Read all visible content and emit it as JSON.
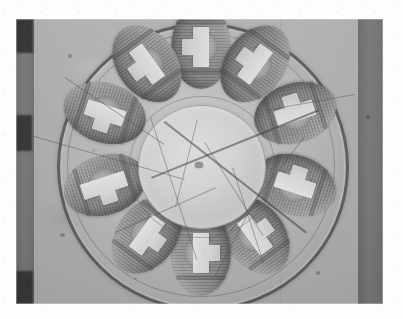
{
  "page": {
    "background_color": "#fdfdfb",
    "media": "halftone printed photograph"
  },
  "photo": {
    "caption": "",
    "kind": "black-and-white halftone photograph",
    "subject": "radial coil assembly (stator / armature) with ten wound coils around a central hub",
    "frame": {
      "x": 16,
      "y": 19,
      "width": 367,
      "height": 285
    },
    "tone": {
      "paper": "#fdfdfb",
      "midtone": "#b9b8b2",
      "highlight": "#f2f1ec",
      "shadow": "#3a3834",
      "rim": "#3a3834"
    },
    "background": {
      "name": "light textured board wall",
      "color": "#bcbbb4",
      "posts": [
        {
          "name": "left-post",
          "x": 0,
          "width": 18,
          "color": "#5c5a55"
        },
        {
          "name": "right-post",
          "x": 342,
          "width": 26,
          "color": "#6c6a64"
        }
      ],
      "specks": [
        {
          "x": 52,
          "y": 35,
          "r": 2.2
        },
        {
          "x": 245,
          "y": 30,
          "r": 2.0
        },
        {
          "x": 350,
          "y": 96,
          "r": 2.0
        },
        {
          "x": 44,
          "y": 214,
          "r": 2.4
        },
        {
          "x": 300,
          "y": 252,
          "r": 2.0
        },
        {
          "x": 118,
          "y": 258,
          "r": 1.8
        },
        {
          "x": 76,
          "y": 130,
          "r": 1.6
        }
      ]
    },
    "assembly": {
      "name": "coil assembly",
      "outer_rim": {
        "name": "outer rim ring",
        "color": "#3a3834",
        "stroke": 3
      },
      "hub": {
        "name": "central hub disc",
        "color": "#dcdbd4"
      },
      "coil_count": 10,
      "coils": [
        {
          "id": 1,
          "label": "coil-1",
          "angle": 0,
          "cx": 146,
          "cy": 30
        },
        {
          "id": 2,
          "label": "coil-2",
          "angle": 36,
          "cx": 200,
          "cy": 47
        },
        {
          "id": 3,
          "label": "coil-3",
          "angle": 72,
          "cx": 240,
          "cy": 96
        },
        {
          "id": 4,
          "label": "coil-4",
          "angle": 108,
          "cx": 240,
          "cy": 168
        },
        {
          "id": 5,
          "label": "coil-5",
          "angle": 144,
          "cx": 200,
          "cy": 218
        },
        {
          "id": 6,
          "label": "coil-6",
          "angle": 180,
          "cx": 146,
          "cy": 236
        },
        {
          "id": 7,
          "label": "coil-7",
          "angle": 216,
          "cx": 92,
          "cy": 218
        },
        {
          "id": 8,
          "label": "coil-8",
          "angle": 252,
          "cx": 50,
          "cy": 168
        },
        {
          "id": 9,
          "label": "coil-9",
          "angle": 288,
          "cx": 50,
          "cy": 96
        },
        {
          "id": 10,
          "label": "coil-10",
          "angle": 324,
          "cx": 92,
          "cy": 47
        }
      ],
      "coil_detail": {
        "winding_color": "#8a8780",
        "tape_color": "#f2f1ec",
        "note": "each coil is an oval winding with a light insulating tape band across its middle"
      },
      "wires": [
        {
          "name": "lead-wire-1",
          "x": 10,
          "y": 60,
          "len": 120,
          "rot": 34
        },
        {
          "name": "lead-wire-2",
          "x": 0,
          "y": 118,
          "len": 150,
          "rot": 16
        },
        {
          "name": "lead-wire-3",
          "x": 120,
          "y": 150,
          "len": 170,
          "rot": -22
        },
        {
          "name": "lead-wire-4",
          "x": 130,
          "y": 100,
          "len": 170,
          "rot": 38
        },
        {
          "name": "lead-wire-5",
          "x": 300,
          "y": 78,
          "len": 90,
          "rot": 170
        },
        {
          "name": "lead-wire-6",
          "x": 160,
          "y": 258,
          "len": 120,
          "rot": -62
        },
        {
          "name": "lead-wire-7",
          "x": 208,
          "y": 246,
          "len": 100,
          "rot": -108
        },
        {
          "name": "lead-wire-8",
          "x": 96,
          "y": 110,
          "len": 150,
          "rot": 72
        },
        {
          "name": "lead-wire-9",
          "x": 250,
          "y": 130,
          "len": 120,
          "rot": 128
        },
        {
          "name": "lead-wire-10",
          "x": 60,
          "y": 215,
          "len": 110,
          "rot": -24
        }
      ]
    }
  }
}
